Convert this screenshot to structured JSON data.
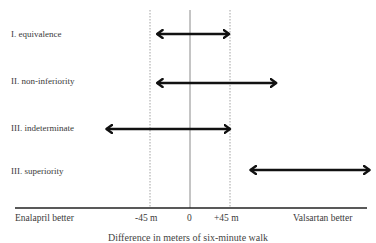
{
  "diagram": {
    "rows": [
      {
        "label": "I. equivalence",
        "from": -37,
        "to": 44
      },
      {
        "label": "II. non-inferiority",
        "from": -37,
        "to": 97
      },
      {
        "label": "III. indeterminate",
        "from": -94,
        "to": 45
      },
      {
        "label": "III. superiority",
        "from": 68,
        "to": 202
      }
    ],
    "margin_lower": -45,
    "margin_upper": 45,
    "zero": 0,
    "axis": {
      "left_label": "Enalapril better",
      "right_label": "Valsartan better",
      "tick_minus": "-45 m",
      "tick_zero": "0",
      "tick_plus": "+45 m",
      "caption": "Difference in meters of six-minute walk"
    },
    "colors": {
      "arrow": "#111111",
      "guide": "#999999",
      "axis": "#222222"
    }
  }
}
